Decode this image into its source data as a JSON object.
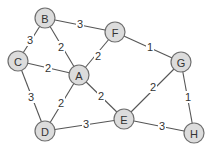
{
  "diagram": {
    "type": "weighted-undirected-graph",
    "colors": {
      "node_fill": "#dcdcdc",
      "node_stroke": "#6f6f6f",
      "edge": "#555555",
      "text": "#333333",
      "background": "#ffffff"
    },
    "nodes": [
      {
        "id": "A",
        "label": "A",
        "x": 79,
        "y": 75
      },
      {
        "id": "B",
        "label": "B",
        "x": 45,
        "y": 18
      },
      {
        "id": "C",
        "label": "C",
        "x": 18,
        "y": 61
      },
      {
        "id": "D",
        "label": "D",
        "x": 45,
        "y": 131
      },
      {
        "id": "E",
        "label": "E",
        "x": 124,
        "y": 119
      },
      {
        "id": "F",
        "label": "F",
        "x": 115,
        "y": 32
      },
      {
        "id": "G",
        "label": "G",
        "x": 181,
        "y": 62
      },
      {
        "id": "H",
        "label": "H",
        "x": 194,
        "y": 133
      }
    ],
    "edges": [
      {
        "from": "B",
        "to": "F",
        "weight": "3",
        "lx": 80,
        "ly": 24
      },
      {
        "from": "B",
        "to": "C",
        "weight": "3",
        "lx": 30,
        "ly": 40
      },
      {
        "from": "B",
        "to": "A",
        "weight": "2",
        "lx": 61,
        "ly": 47
      },
      {
        "from": "F",
        "to": "A",
        "weight": "2",
        "lx": 98,
        "ly": 56
      },
      {
        "from": "F",
        "to": "G",
        "weight": "1",
        "lx": 150,
        "ly": 47
      },
      {
        "from": "C",
        "to": "A",
        "weight": "2",
        "lx": 48,
        "ly": 68
      },
      {
        "from": "C",
        "to": "D",
        "weight": "3",
        "lx": 31,
        "ly": 97
      },
      {
        "from": "A",
        "to": "D",
        "weight": "2",
        "lx": 61,
        "ly": 103
      },
      {
        "from": "A",
        "to": "E",
        "weight": "2",
        "lx": 101,
        "ly": 96
      },
      {
        "from": "G",
        "to": "E",
        "weight": "2",
        "lx": 153,
        "ly": 87
      },
      {
        "from": "G",
        "to": "H",
        "weight": "1",
        "lx": 188,
        "ly": 97
      },
      {
        "from": "D",
        "to": "E",
        "weight": "3",
        "lx": 86,
        "ly": 124
      },
      {
        "from": "E",
        "to": "H",
        "weight": "3",
        "lx": 162,
        "ly": 126
      }
    ]
  }
}
